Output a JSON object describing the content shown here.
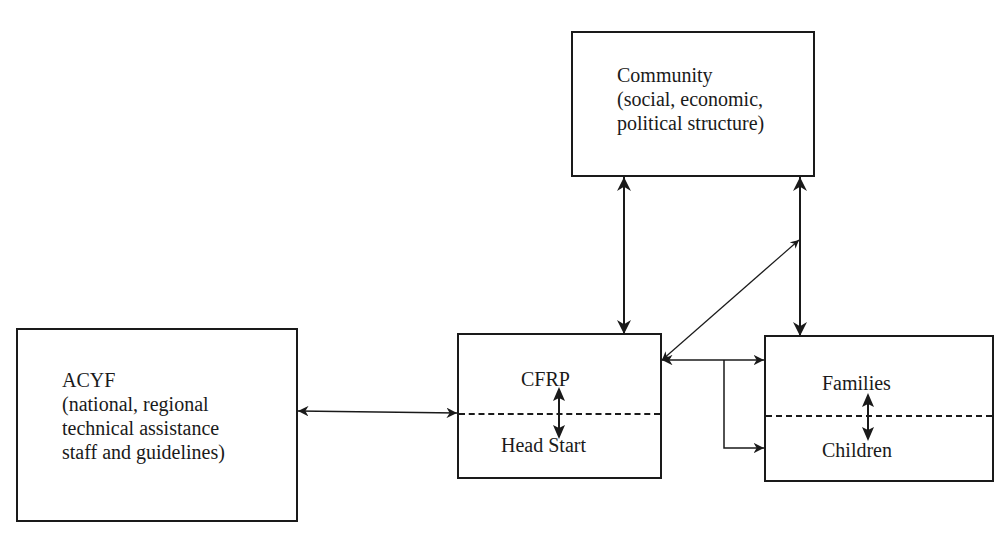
{
  "diagram": {
    "nodes": {
      "community": {
        "title": "Community",
        "line2": "(social, economic,",
        "line3": "political structure)"
      },
      "acyf": {
        "title": "ACYF",
        "line2": "(national, regional",
        "line3": "technical assistance",
        "line4": "staff and guidelines)"
      },
      "cfrp_headstart": {
        "top_label": "CFRP",
        "bottom_label": "Head Start"
      },
      "families_children": {
        "top_label": "Families",
        "bottom_label": "Children"
      }
    },
    "edges": [
      {
        "from": "acyf",
        "to": "cfrp_headstart",
        "type": "bidirectional"
      },
      {
        "from": "community",
        "to": "cfrp_headstart",
        "type": "bidirectional"
      },
      {
        "from": "community",
        "to": "families_children",
        "type": "bidirectional"
      },
      {
        "from": "cfrp_headstart",
        "to": "community-families link",
        "type": "bidirectional-diagonal"
      },
      {
        "from": "cfrp_headstart",
        "to": "families",
        "type": "bidirectional"
      },
      {
        "from": "cfrp_headstart",
        "to": "children",
        "type": "directed"
      },
      {
        "from": "cfrp",
        "to": "head_start",
        "type": "bidirectional-internal"
      },
      {
        "from": "families",
        "to": "children",
        "type": "bidirectional-internal"
      }
    ]
  }
}
